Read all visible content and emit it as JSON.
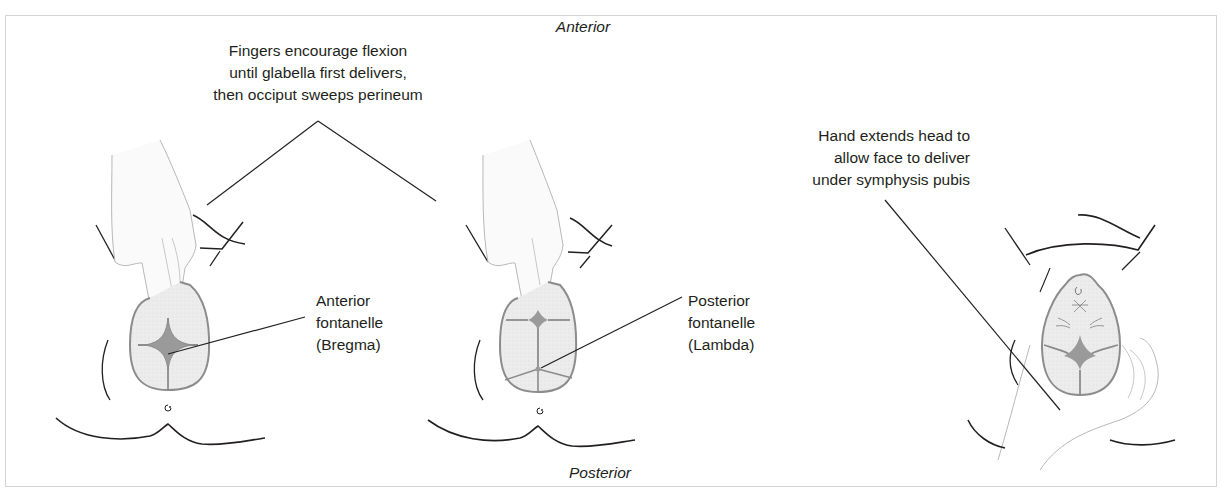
{
  "figure": {
    "caption_clipped": "",
    "orientation": {
      "top_label": "Anterior",
      "bottom_label": "Posterior"
    },
    "panels": [
      {
        "id": "panel-1",
        "description": "Occipito-posterior head with fingers on vertex; anterior fontanelle presenting",
        "label": [
          "Anterior",
          "fontanelle",
          "(Bregma)"
        ]
      },
      {
        "id": "panel-2",
        "description": "Head flexed by fingers; posterior fontanelle presenting",
        "label": [
          "Posterior",
          "fontanelle",
          "(Lambda)"
        ]
      },
      {
        "id": "panel-3",
        "description": "Face-up head cradled by hand after occiput delivers",
        "label": []
      }
    ],
    "annotations": {
      "flexion_note": [
        "Fingers encourage flexion",
        "until glabella first delivers,",
        "then occiput sweeps perineum"
      ],
      "extension_note": [
        "Hand extends head to",
        "allow face to deliver",
        "under symphysis pubis"
      ]
    },
    "colors": {
      "line": "#231f20",
      "skull_fill": "#ececec",
      "fontanelle_fill": "#9a9a9a",
      "hand_stroke": "#b8b8b8",
      "frame_border": "#d4d4d4"
    }
  }
}
